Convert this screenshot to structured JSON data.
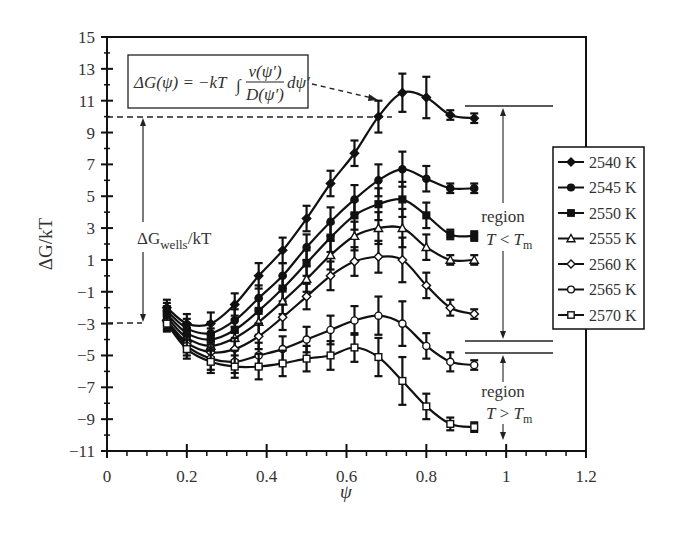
{
  "chart_data": {
    "type": "line",
    "title": "",
    "xlabel": "ψ",
    "ylabel": "ΔG/kT",
    "xlim": [
      0,
      1.2
    ],
    "ylim": [
      -11,
      15
    ],
    "xticks": [
      0,
      0.2,
      0.4,
      0.6,
      0.8,
      1,
      1.2
    ],
    "xtick_labels": [
      "0",
      "0.2",
      "0.4",
      "0.6",
      "0.8",
      "1",
      "1.2"
    ],
    "yticks": [
      15,
      13,
      11,
      9,
      7,
      5,
      3,
      1,
      -1,
      -3,
      -5,
      -7,
      -9,
      -11
    ],
    "ytick_labels": [
      "15",
      "13",
      "11",
      "9",
      "7",
      "5",
      "3",
      "1",
      "−1",
      "−3",
      "−5",
      "−7",
      "−9",
      "−11"
    ],
    "grid": false,
    "legend_position": "right-outside",
    "error_bars": true,
    "x": [
      0.15,
      0.2,
      0.26,
      0.32,
      0.38,
      0.44,
      0.5,
      0.56,
      0.62,
      0.68,
      0.74,
      0.8,
      0.86,
      0.92
    ],
    "series": [
      {
        "name": "2540 K",
        "marker": "diamond-filled",
        "values": [
          -2.0,
          -3.0,
          -3.0,
          -1.8,
          0.0,
          1.6,
          3.6,
          5.8,
          7.7,
          10.0,
          11.5,
          11.2,
          10.1,
          9.9
        ],
        "errors": [
          0.5,
          0.6,
          0.7,
          0.7,
          0.8,
          0.8,
          0.8,
          0.8,
          0.8,
          1.0,
          1.2,
          1.3,
          0.3,
          0.3
        ]
      },
      {
        "name": "2545 K",
        "marker": "circle-filled",
        "values": [
          -2.2,
          -3.3,
          -3.6,
          -2.8,
          -1.4,
          0.0,
          1.8,
          3.4,
          4.8,
          6.0,
          6.7,
          6.1,
          5.5,
          5.5
        ],
        "errors": [
          0.5,
          0.6,
          0.7,
          0.7,
          0.8,
          0.8,
          0.8,
          0.9,
          0.9,
          1.0,
          1.1,
          0.8,
          0.3,
          0.3
        ]
      },
      {
        "name": "2550 K",
        "marker": "square-filled",
        "values": [
          -2.4,
          -3.6,
          -4.0,
          -3.4,
          -2.2,
          -0.8,
          0.8,
          2.4,
          3.8,
          4.5,
          4.8,
          3.8,
          2.6,
          2.5
        ],
        "errors": [
          0.5,
          0.6,
          0.7,
          0.7,
          0.8,
          0.8,
          0.8,
          0.9,
          0.9,
          1.0,
          1.1,
          0.8,
          0.3,
          0.3
        ]
      },
      {
        "name": "2555 K",
        "marker": "triangle-open",
        "values": [
          -2.6,
          -3.9,
          -4.4,
          -3.9,
          -2.9,
          -1.6,
          -0.2,
          1.3,
          2.5,
          3.0,
          3.0,
          1.8,
          1.0,
          1.0
        ],
        "errors": [
          0.5,
          0.6,
          0.7,
          0.7,
          0.8,
          0.8,
          0.8,
          0.9,
          0.9,
          1.0,
          1.2,
          0.8,
          0.3,
          0.3
        ]
      },
      {
        "name": "2560 K",
        "marker": "diamond-open",
        "values": [
          -2.8,
          -4.2,
          -4.8,
          -4.6,
          -3.8,
          -2.6,
          -1.3,
          0.0,
          0.9,
          1.2,
          1.0,
          -0.6,
          -2.0,
          -2.4
        ],
        "errors": [
          0.5,
          0.6,
          0.7,
          0.7,
          0.8,
          0.8,
          0.8,
          0.9,
          0.9,
          1.0,
          1.4,
          0.8,
          0.5,
          0.3
        ]
      },
      {
        "name": "2565 K",
        "marker": "circle-open",
        "values": [
          -2.9,
          -4.4,
          -5.2,
          -5.4,
          -5.0,
          -4.6,
          -4.0,
          -3.4,
          -2.8,
          -2.5,
          -3.0,
          -4.4,
          -5.4,
          -5.6
        ],
        "errors": [
          0.5,
          0.6,
          0.7,
          0.7,
          0.8,
          0.8,
          0.8,
          0.9,
          0.9,
          1.2,
          1.4,
          0.8,
          0.6,
          0.3
        ]
      },
      {
        "name": "2570 K",
        "marker": "square-open",
        "values": [
          -3.0,
          -4.6,
          -5.4,
          -5.7,
          -5.7,
          -5.5,
          -5.2,
          -5.0,
          -4.5,
          -5.1,
          -6.6,
          -8.2,
          -9.3,
          -9.5
        ],
        "errors": [
          0.5,
          0.6,
          0.7,
          0.7,
          0.8,
          0.8,
          0.8,
          0.9,
          0.9,
          1.2,
          1.5,
          0.8,
          0.4,
          0.3
        ]
      }
    ],
    "annotations": [
      {
        "text": "ΔG(ψ) = −kT ∫ ν(ψ′)/D(ψ′) dψ′",
        "type": "formula-box",
        "arrow_to": [
          0.72,
          11.5
        ]
      },
      {
        "text": "ΔG_wells/kT",
        "type": "double-arrow",
        "from": [
          0.09,
          -3
        ],
        "to": [
          0.09,
          10
        ],
        "dashed_refs": [
          10,
          -3
        ]
      },
      {
        "text": "region T < T_m",
        "type": "double-arrow",
        "range": [
          10.6,
          -4
        ]
      },
      {
        "text": "region T > T_m",
        "type": "arrow-region",
        "range": [
          -4.8,
          -11
        ]
      }
    ]
  },
  "axes": {
    "x_title": "ψ",
    "y_title": "ΔG/kT"
  },
  "formula": {
    "lhs": "ΔG(ψ) = −kT",
    "integral": "∫",
    "num": "ν(ψ′)",
    "den": "D(ψ′)",
    "tail": "dψ′"
  },
  "annotations": {
    "wells_delta": "ΔG",
    "wells_sub": "wells",
    "wells_tail": "/kT",
    "region_low_label": "region",
    "region_low_T": "T",
    "region_low_op": " < ",
    "region_low_Tm": "T",
    "region_low_sub": "m",
    "region_high_label": "region",
    "region_high_T": "T",
    "region_high_op": " > ",
    "region_high_Tm": "T",
    "region_high_sub": "m"
  },
  "legend": {
    "items": [
      "2540 K",
      "2545 K",
      "2550 K",
      "2555 K",
      "2560 K",
      "2565 K",
      "2570 K"
    ]
  },
  "colors": {
    "line": "#111111",
    "text": "#333333",
    "background": "#ffffff"
  }
}
